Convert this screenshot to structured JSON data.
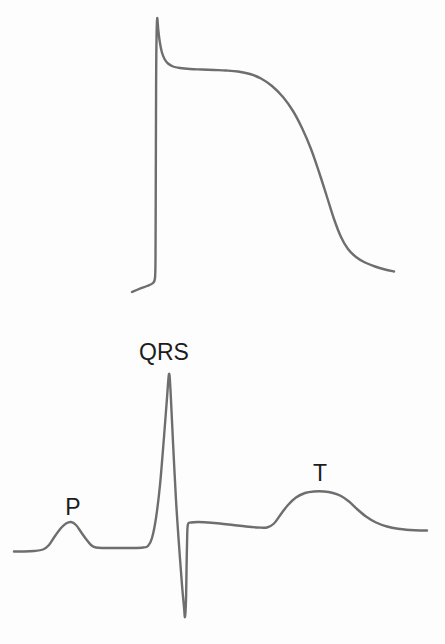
{
  "figure": {
    "background_color": "#fdfdfd",
    "trace_color": "#6e6e6e",
    "label_color": "#1c1c1c",
    "panels": {
      "action_potential": {
        "points": [
          [
            132,
            292
          ],
          [
            139,
            289
          ],
          [
            147,
            286
          ],
          [
            153,
            283
          ],
          [
            155,
            278
          ],
          [
            155.5,
            260
          ],
          [
            155.6,
            235
          ],
          [
            155.7,
            205
          ],
          [
            155.8,
            175
          ],
          [
            155.9,
            145
          ],
          [
            156,
            115
          ],
          [
            156.1,
            85
          ],
          [
            156.3,
            55
          ],
          [
            156.6,
            33
          ],
          [
            157.2,
            18
          ],
          [
            158.3,
            30
          ],
          [
            159.8,
            42
          ],
          [
            161.8,
            52
          ],
          [
            164.5,
            59
          ],
          [
            168,
            63.5
          ],
          [
            173,
            66.5
          ],
          [
            180,
            68
          ],
          [
            190,
            69
          ],
          [
            202,
            69.5
          ],
          [
            214,
            70
          ],
          [
            226,
            70.5
          ],
          [
            238,
            71.5
          ],
          [
            250,
            74
          ],
          [
            261,
            78.5
          ],
          [
            272,
            86
          ],
          [
            283,
            97
          ],
          [
            293,
            111
          ],
          [
            302,
            128
          ],
          [
            311,
            149
          ],
          [
            319,
            172
          ],
          [
            327,
            197
          ],
          [
            334,
            219
          ],
          [
            341,
            237
          ],
          [
            348,
            249
          ],
          [
            356,
            257
          ],
          [
            365,
            262.5
          ],
          [
            375,
            266.5
          ],
          [
            385,
            269.5
          ],
          [
            394,
            271.5
          ]
        ]
      },
      "ecg": {
        "points": [
          [
            14,
            551.5
          ],
          [
            24,
            551.5
          ],
          [
            34,
            551
          ],
          [
            43,
            549.5
          ],
          [
            49,
            545
          ],
          [
            55,
            536
          ],
          [
            61,
            528
          ],
          [
            66,
            523.5
          ],
          [
            71,
            522
          ],
          [
            76,
            525
          ],
          [
            81,
            532
          ],
          [
            86,
            539
          ],
          [
            91,
            545
          ],
          [
            96,
            547.5
          ],
          [
            104,
            548
          ],
          [
            114,
            548
          ],
          [
            124,
            548
          ],
          [
            134,
            548
          ],
          [
            143,
            547.5
          ],
          [
            148,
            546
          ],
          [
            152,
            538
          ],
          [
            156,
            518
          ],
          [
            160,
            485
          ],
          [
            164,
            437
          ],
          [
            167,
            398
          ],
          [
            169,
            374
          ],
          [
            170.5,
            390
          ],
          [
            173,
            442
          ],
          [
            176,
            500
          ],
          [
            179,
            545
          ],
          [
            182,
            585
          ],
          [
            184,
            607
          ],
          [
            185,
            617
          ],
          [
            186,
            600
          ],
          [
            186.6,
            565
          ],
          [
            187.2,
            535
          ],
          [
            188,
            524
          ],
          [
            191,
            522.5
          ],
          [
            198,
            522
          ],
          [
            208,
            522.5
          ],
          [
            220,
            523.5
          ],
          [
            233,
            525
          ],
          [
            246,
            526.5
          ],
          [
            258,
            527.5
          ],
          [
            267,
            527.5
          ],
          [
            274,
            523.5
          ],
          [
            281,
            514
          ],
          [
            288,
            505
          ],
          [
            296,
            497.5
          ],
          [
            305,
            493
          ],
          [
            314,
            491.5
          ],
          [
            324,
            491.5
          ],
          [
            333,
            493
          ],
          [
            341,
            496
          ],
          [
            349,
            501.5
          ],
          [
            357,
            509
          ],
          [
            366,
            516.5
          ],
          [
            376,
            522.5
          ],
          [
            387,
            526.5
          ],
          [
            398,
            528.8
          ],
          [
            410,
            530
          ],
          [
            420,
            530.5
          ],
          [
            427,
            530.5
          ]
        ],
        "labels": [
          {
            "text": "QRS",
            "x": 164,
            "y": 360
          },
          {
            "text": "P",
            "x": 73,
            "y": 515
          },
          {
            "text": "T",
            "x": 320,
            "y": 481
          }
        ]
      }
    }
  }
}
